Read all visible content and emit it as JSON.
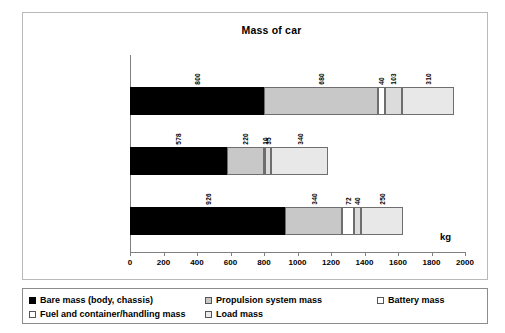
{
  "chart_data": {
    "type": "bar",
    "orientation": "horizontal",
    "stacked": true,
    "title": "Mass of car",
    "xlabel": "kg",
    "ylabel": "",
    "xlim": [
      0,
      2000
    ],
    "xticks": [
      0,
      200,
      400,
      600,
      800,
      1000,
      1200,
      1400,
      1600,
      1800,
      2000
    ],
    "grid": false,
    "legend_position": "bottom",
    "categories": [
      "DaimlerChrysler f-cell",
      "VW Lupo 3L",
      "Toyota Camry"
    ],
    "series": [
      {
        "name": "Bare mass (body, chassis)",
        "key": "bare",
        "color": "#000000",
        "values": [
          800,
          578,
          926
        ]
      },
      {
        "name": "Propulsion system mass",
        "key": "prop",
        "color": "#c8c8c8",
        "values": [
          680,
          220,
          340
        ]
      },
      {
        "name": "Battery mass",
        "key": "batt",
        "color": "#ffffff",
        "values": [
          40,
          10,
          72
        ]
      },
      {
        "name": "Fuel and container/handling mass",
        "key": "fuel",
        "color": "#dcdcdc",
        "values": [
          103,
          35,
          40
        ]
      },
      {
        "name": "Load mass",
        "key": "load",
        "color": "#e8e8e8",
        "values": [
          310,
          340,
          250
        ]
      }
    ],
    "totals": [
      1933,
      1183,
      1628
    ],
    "data_labels": {
      "DaimlerChrysler f-cell": [
        "800",
        "680",
        "40",
        "103",
        "310"
      ],
      "VW Lupo 3L": [
        "578",
        "220",
        "10",
        "35",
        "340"
      ],
      "Toyota Camry": [
        "926",
        "340",
        "72",
        "40",
        "250"
      ]
    }
  },
  "legend": {
    "items": [
      {
        "label": "Bare mass (body, chassis)",
        "key": "bare"
      },
      {
        "label": "Propulsion system mass",
        "key": "prop"
      },
      {
        "label": "Battery mass",
        "key": "batt"
      },
      {
        "label": "Fuel and container/handling mass",
        "key": "fuel"
      },
      {
        "label": "Load mass",
        "key": "load"
      }
    ]
  }
}
